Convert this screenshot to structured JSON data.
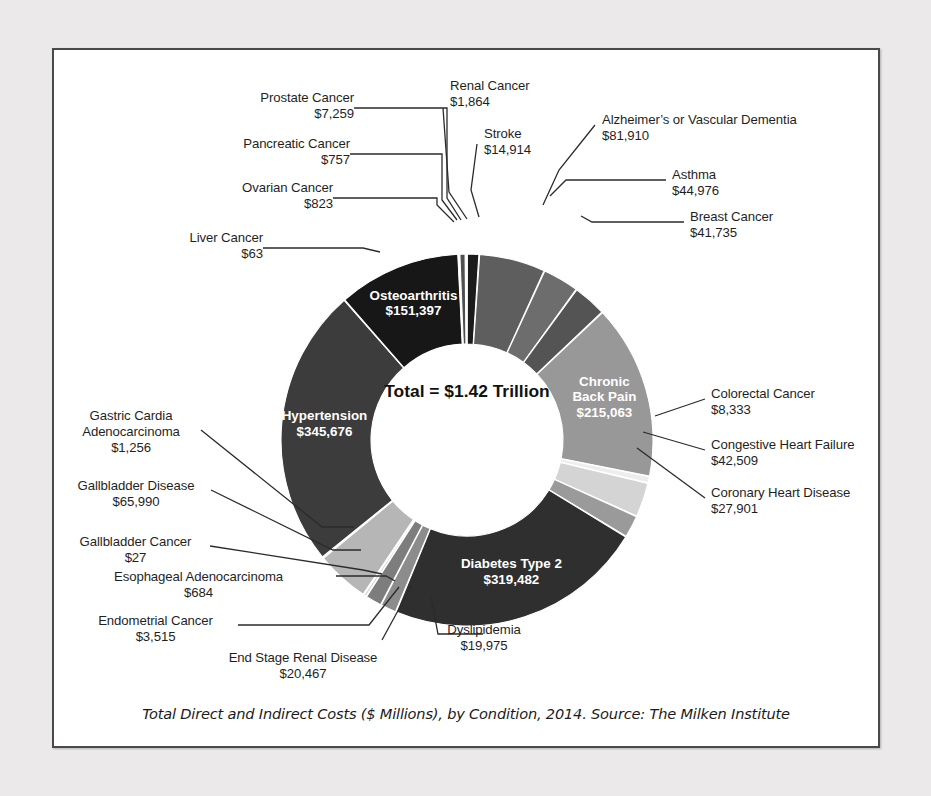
{
  "caption": "Total Direct and Indirect Costs ($ Millions), by Condition, 2014. Source: The Milken Institute",
  "center_text": "Total = $1.42 Trillion",
  "colors": {
    "background": "#ebe9e9",
    "panel": "#ffffff",
    "frame_border": "#4a4a4a",
    "leader_line": "#2b2b2b",
    "text": "#1f1f1f"
  },
  "chart_data": {
    "type": "pie",
    "variant": "donut",
    "title": "",
    "subtitle": "",
    "units": "$ Millions",
    "year": 2014,
    "source": "The Milken Institute",
    "total_label": "Total = $1.42 Trillion",
    "total_value": 1419000,
    "start_angle_deg": 0,
    "direction": "clockwise",
    "legend": "none (direct labels with leader lines)",
    "labels": [
      "Stroke",
      "Alzheimer's or Vascular Dementia",
      "Asthma",
      "Breast Cancer",
      "Chronic Back Pain",
      "Colorectal Cancer",
      "Congestive Heart Failure",
      "Coronary Heart Disease",
      "Diabetes Type 2",
      "Dyslipidemia",
      "End Stage Renal Disease",
      "Endometrial Cancer",
      "Esophageal Adenocarcinoma",
      "Gallbladder Cancer",
      "Gallbladder Disease",
      "Gastric Cardia Adenocarcinoma",
      "Hypertension",
      "Liver Cancer",
      "Osteoarthritis",
      "Ovarian Cancer",
      "Pancreatic Cancer",
      "Prostate Cancer",
      "Renal Cancer"
    ],
    "values": [
      14914,
      81910,
      44976,
      41735,
      215063,
      8333,
      42509,
      27901,
      319482,
      19975,
      20467,
      3515,
      684,
      27,
      65990,
      1256,
      345676,
      63,
      151397,
      823,
      757,
      7259,
      1864
    ],
    "slices": [
      {
        "name": "Stroke",
        "value": 14914,
        "display": "$14,914",
        "color": "#1b1b1b",
        "label_placement": "outside"
      },
      {
        "name": "Alzheimer's or Vascular Dementia",
        "value": 81910,
        "display": "$81,910",
        "color": "#5e5e5e",
        "label_placement": "outside"
      },
      {
        "name": "Asthma",
        "value": 44976,
        "display": "$44,976",
        "color": "#6d6d6d",
        "label_placement": "outside"
      },
      {
        "name": "Breast Cancer",
        "value": 41735,
        "display": "$41,735",
        "color": "#545454",
        "label_placement": "outside"
      },
      {
        "name": "Chronic Back Pain",
        "value": 215063,
        "display": "$215,063",
        "color": "#989898",
        "label_placement": "inside"
      },
      {
        "name": "Colorectal Cancer",
        "value": 8333,
        "display": "$8,333",
        "color": "#ededed",
        "label_placement": "outside"
      },
      {
        "name": "Congestive Heart Failure",
        "value": 42509,
        "display": "$42,509",
        "color": "#d4d4d4",
        "label_placement": "outside"
      },
      {
        "name": "Coronary Heart Disease",
        "value": 27901,
        "display": "$27,901",
        "color": "#9a9a9a",
        "label_placement": "outside"
      },
      {
        "name": "Diabetes Type 2",
        "value": 319482,
        "display": "$319,482",
        "color": "#2f2f2f",
        "label_placement": "inside"
      },
      {
        "name": "Dyslipidemia",
        "value": 19975,
        "display": "$19,975",
        "color": "#8c8c8c",
        "label_placement": "outside"
      },
      {
        "name": "End Stage Renal Disease",
        "value": 20467,
        "display": "$20,467",
        "color": "#7d7d7d",
        "label_placement": "outside"
      },
      {
        "name": "Endometrial Cancer",
        "value": 3515,
        "display": "$3,515",
        "color": "#c9c9c9",
        "label_placement": "outside"
      },
      {
        "name": "Esophageal Adenocarcinoma",
        "value": 684,
        "display": "$684",
        "color": "#9f9f9f",
        "label_placement": "outside"
      },
      {
        "name": "Gallbladder Cancer",
        "value": 27,
        "display": "$27",
        "color": "#d8d8d8",
        "label_placement": "outside"
      },
      {
        "name": "Gallbladder Disease",
        "value": 65990,
        "display": "$65,990",
        "color": "#b6b6b6",
        "label_placement": "outside"
      },
      {
        "name": "Gastric Cardia Adenocarcinoma",
        "value": 1256,
        "display": "$1,256",
        "color": "#8f8f8f",
        "label_placement": "outside"
      },
      {
        "name": "Hypertension",
        "value": 345676,
        "display": "$345,676",
        "color": "#3c3c3c",
        "label_placement": "inside"
      },
      {
        "name": "Liver Cancer",
        "value": 63,
        "display": "$63",
        "color": "#cfcfcf",
        "label_placement": "outside"
      },
      {
        "name": "Osteoarthritis",
        "value": 151397,
        "display": "$151,397",
        "color": "#171717",
        "label_placement": "inside"
      },
      {
        "name": "Ovarian Cancer",
        "value": 823,
        "display": "$823",
        "color": "#707070",
        "label_placement": "outside"
      },
      {
        "name": "Pancreatic Cancer",
        "value": 757,
        "display": "$757",
        "color": "#bdbdbd",
        "label_placement": "outside"
      },
      {
        "name": "Prostate Cancer",
        "value": 7259,
        "display": "$7,259",
        "color": "#4f4f4f",
        "label_placement": "outside"
      },
      {
        "name": "Renal Cancer",
        "value": 1864,
        "display": "$1,864",
        "color": "#a8a8a8",
        "label_placement": "outside"
      }
    ]
  },
  "inside_labels": {
    "osteoarthritis": {
      "name": "Osteoarthritis",
      "value": "$151,397"
    },
    "hypertension": {
      "name": "Hypertension",
      "value": "$345,676"
    },
    "chronic_back_pain_l1": "Chronic",
    "chronic_back_pain_l2": "Back Pain",
    "chronic_back_pain_value": "$215,063",
    "diabetes": {
      "name": "Diabetes Type 2",
      "value": "$319,482"
    }
  },
  "callouts": {
    "renal_cancer": {
      "name": "Renal Cancer",
      "value": "$1,864"
    },
    "stroke": {
      "name": "Stroke",
      "value": "$14,914"
    },
    "prostate_cancer": {
      "name": "Prostate Cancer",
      "value": "$7,259"
    },
    "pancreatic_cancer": {
      "name": "Pancreatic Cancer",
      "value": "$757"
    },
    "ovarian_cancer": {
      "name": "Ovarian Cancer",
      "value": "$823"
    },
    "liver_cancer": {
      "name": "Liver Cancer",
      "value": "$63"
    },
    "alzheimers": {
      "name": "Alzheimer’s or Vascular Dementia",
      "value": "$81,910"
    },
    "asthma": {
      "name": "Asthma",
      "value": "$44,976"
    },
    "breast_cancer": {
      "name": "Breast Cancer",
      "value": "$41,735"
    },
    "colorectal_cancer": {
      "name": "Colorectal Cancer",
      "value": "$8,333"
    },
    "congestive_heart_failure": {
      "name": "Congestive Heart Failure",
      "value": "$42,509"
    },
    "coronary_heart_disease": {
      "name": "Coronary Heart Disease",
      "value": "$27,901"
    },
    "gastric_cardia_l1": "Gastric Cardia",
    "gastric_cardia_l2": "Adenocarcinoma",
    "gastric_cardia_value": "$1,256",
    "gallbladder_disease": {
      "name": "Gallbladder Disease",
      "value": "$65,990"
    },
    "gallbladder_cancer": {
      "name": "Gallbladder Cancer",
      "value": "$27"
    },
    "esophageal_adenocarcinoma": {
      "name": "Esophageal Adenocarcinoma",
      "value": "$684"
    },
    "endometrial_cancer": {
      "name": "Endometrial Cancer",
      "value": "$3,515"
    },
    "end_stage_renal_disease": {
      "name": "End Stage Renal Disease",
      "value": "$20,467"
    },
    "dyslipidemia": {
      "name": "Dyslipidemia",
      "value": "$19,975"
    }
  }
}
